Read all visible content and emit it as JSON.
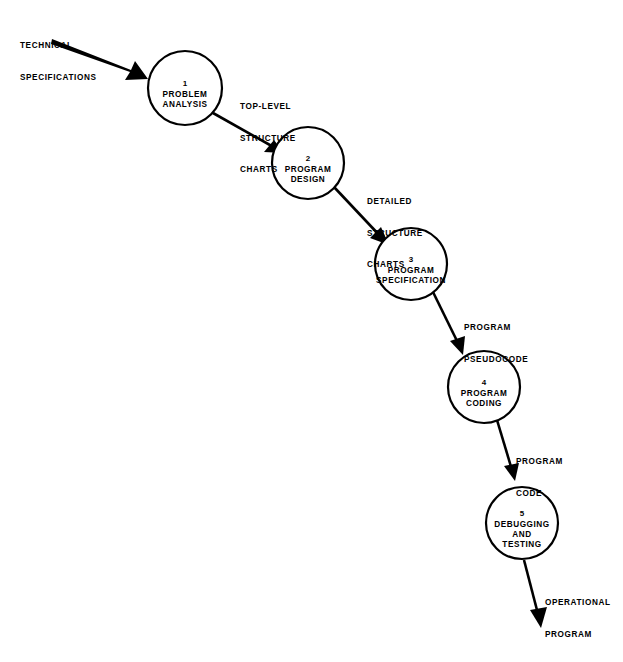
{
  "diagram": {
    "background_color": "#ffffff",
    "stroke_color": "#000000",
    "nodes": [
      {
        "number": "1",
        "lines": [
          "PROBLEM",
          "ANALYSIS"
        ],
        "cx": 185,
        "cy": 88,
        "r": 37
      },
      {
        "number": "2",
        "lines": [
          "PROGRAM",
          "DESIGN"
        ],
        "cx": 308,
        "cy": 163,
        "r": 36
      },
      {
        "number": "3",
        "lines": [
          "PROGRAM",
          "SPECIFICATION"
        ],
        "cx": 411,
        "cy": 264,
        "r": 36
      },
      {
        "number": "4",
        "lines": [
          "PROGRAM",
          "CODING"
        ],
        "cx": 484,
        "cy": 387,
        "r": 36
      },
      {
        "number": "5",
        "lines": [
          "DEBUGGING",
          "AND",
          "TESTING"
        ],
        "cx": 522,
        "cy": 523,
        "r": 36
      }
    ],
    "flow_labels": [
      {
        "id": "input",
        "lines": [
          "TECHNICAL",
          "SPECIFICATIONS"
        ],
        "x": 20,
        "y": 20
      },
      {
        "id": "edge-1-2",
        "lines": [
          "TOP-LEVEL",
          "STRUCTURE",
          "CHARTS"
        ],
        "x": 240,
        "y": 81
      },
      {
        "id": "edge-2-3",
        "lines": [
          "DETAILED",
          "STRUCTURE",
          "CHARTS"
        ],
        "x": 367,
        "y": 176
      },
      {
        "id": "edge-3-4",
        "lines": [
          "PROGRAM",
          "PSEUDOCODE"
        ],
        "x": 464,
        "y": 302
      },
      {
        "id": "edge-4-5",
        "lines": [
          "PROGRAM",
          "CODE"
        ],
        "x": 516,
        "y": 436
      },
      {
        "id": "output",
        "lines": [
          "OPERATIONAL",
          "PROGRAM"
        ],
        "x": 545,
        "y": 577
      }
    ],
    "arrows": [
      {
        "id": "arrow-input-to-1",
        "from": "TECHNICAL SPECIFICATIONS",
        "to": "1 PROBLEM ANALYSIS"
      },
      {
        "id": "arrow-1-to-2",
        "from": "1 PROBLEM ANALYSIS",
        "to": "2 PROGRAM DESIGN"
      },
      {
        "id": "arrow-2-to-3",
        "from": "2 PROGRAM DESIGN",
        "to": "3 PROGRAM SPECIFICATION"
      },
      {
        "id": "arrow-3-to-4",
        "from": "3 PROGRAM SPECIFICATION",
        "to": "4 PROGRAM CODING"
      },
      {
        "id": "arrow-4-to-5",
        "from": "4 PROGRAM CODING",
        "to": "5 DEBUGGING AND TESTING"
      },
      {
        "id": "arrow-5-to-output",
        "from": "5 DEBUGGING AND TESTING",
        "to": "OPERATIONAL PROGRAM"
      }
    ]
  }
}
